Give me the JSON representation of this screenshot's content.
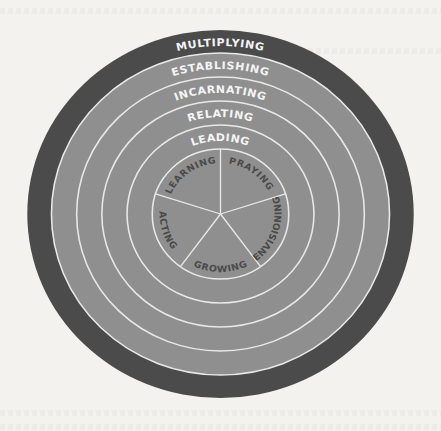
{
  "diagram": {
    "colors": {
      "page_background": "#f3f2ef",
      "outer_ring": "#4b4b4b",
      "inner_fill": "#8f8f8f",
      "separator": "#e8e8e8",
      "ring_text": "#f4f4f4",
      "core_text": "#4a4a4a"
    },
    "rings": [
      {
        "label": "MULTIPLYING",
        "position": "outermost"
      },
      {
        "label": "ESTABLISHING",
        "position": "ring-2"
      },
      {
        "label": "INCARNATING",
        "position": "ring-3"
      },
      {
        "label": "RELATING",
        "position": "ring-4"
      },
      {
        "label": "LEADING",
        "position": "ring-5"
      }
    ],
    "core_segments": [
      {
        "label": "LEARNING",
        "position": "upper-left"
      },
      {
        "label": "PRAYING",
        "position": "upper-right"
      },
      {
        "label": "ENVISIONING",
        "position": "right"
      },
      {
        "label": "GROWING",
        "position": "bottom"
      },
      {
        "label": "ACTING",
        "position": "left"
      }
    ]
  }
}
